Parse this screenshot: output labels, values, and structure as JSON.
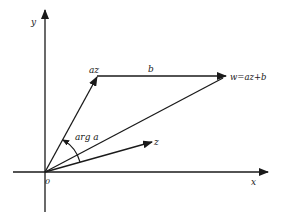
{
  "diagram": {
    "type": "complex-plane-vector-diagram",
    "labels": {
      "y_axis": "y",
      "x_axis": "x",
      "origin": "0",
      "az": "az",
      "b": "b",
      "w": "w=az+b",
      "z": "z",
      "angle": "arg a"
    },
    "colors": {
      "ink": "#1a1a1a",
      "background": "#ffffff"
    }
  }
}
